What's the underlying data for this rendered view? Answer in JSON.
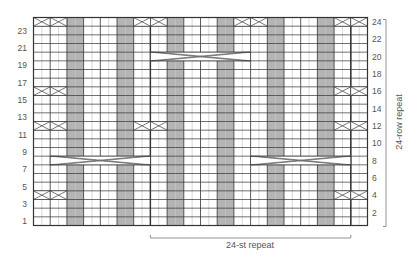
{
  "chart": {
    "title": "",
    "stitches": 40,
    "rows": 24,
    "colors": {
      "background": "#ffffff",
      "shaded": "#b4b4b4",
      "grid_light": "#bdbdbd",
      "grid_dark": "#333333",
      "cable_line": "#555555",
      "cable_fill": "#e8e8e8",
      "label": "#555555"
    },
    "shaded_columns": [
      4,
      5,
      10,
      11,
      16,
      17,
      22,
      23,
      28,
      29,
      34,
      35
    ],
    "repeat_lines_at_col": [
      14,
      38
    ],
    "left_row_labels": [
      1,
      3,
      5,
      7,
      9,
      11,
      13,
      15,
      17,
      19,
      21,
      23
    ],
    "right_row_labels": [
      2,
      4,
      6,
      8,
      10,
      12,
      14,
      16,
      18,
      20,
      22,
      24
    ],
    "small_cables": [
      {
        "row": 4,
        "cols": [
          [
            0,
            1
          ],
          [
            2,
            3
          ],
          [
            36,
            37
          ],
          [
            38,
            39
          ]
        ]
      },
      {
        "row": 12,
        "cols": [
          [
            0,
            1
          ],
          [
            2,
            3
          ],
          [
            12,
            13
          ],
          [
            14,
            15
          ],
          [
            36,
            37
          ],
          [
            38,
            39
          ]
        ]
      },
      {
        "row": 16,
        "cols": [
          [
            0,
            1
          ],
          [
            2,
            3
          ],
          [
            36,
            37
          ],
          [
            38,
            39
          ]
        ]
      },
      {
        "row": 24,
        "cols": [
          [
            0,
            1
          ],
          [
            2,
            3
          ],
          [
            12,
            13
          ],
          [
            14,
            15
          ],
          [
            24,
            25
          ],
          [
            26,
            27
          ],
          [
            36,
            37
          ],
          [
            38,
            39
          ]
        ]
      }
    ],
    "long_cables": [
      {
        "row": 8,
        "start_col": 2,
        "end_col": 13
      },
      {
        "row": 8,
        "start_col": 26,
        "end_col": 37
      },
      {
        "row": 20,
        "start_col": 14,
        "end_col": 25
      }
    ],
    "stitch_repeat_label": "24-st repeat",
    "row_repeat_label": "24-row repeat"
  }
}
